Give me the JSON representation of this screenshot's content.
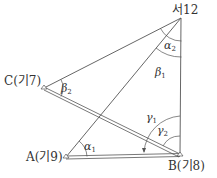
{
  "diagram": {
    "type": "geometry-triangulation",
    "colors": {
      "line": "#555555",
      "text": "#333333",
      "background": "#ffffff"
    },
    "points": {
      "top": {
        "label": "서12",
        "x": 181,
        "y": 18
      },
      "C": {
        "label": "C(기7)",
        "x": 44,
        "y": 88
      },
      "A": {
        "label": "A(기9)",
        "x": 66,
        "y": 157
      },
      "B": {
        "label": "B(기8)",
        "x": 180,
        "y": 155
      }
    },
    "angles": {
      "alpha1": {
        "symbol": "α",
        "sub": "1"
      },
      "alpha2": {
        "symbol": "α",
        "sub": "2"
      },
      "beta1": {
        "symbol": "β",
        "sub": "1"
      },
      "beta2": {
        "symbol": "β",
        "sub": "2"
      },
      "gamma1": {
        "symbol": "γ",
        "sub": "1"
      },
      "gamma2": {
        "symbol": "γ",
        "sub": "2"
      }
    },
    "edges": [
      {
        "from": "top",
        "to": "C",
        "style": "single"
      },
      {
        "from": "top",
        "to": "A",
        "style": "single"
      },
      {
        "from": "top",
        "to": "B",
        "style": "single"
      },
      {
        "from": "C",
        "to": "B",
        "style": "double"
      },
      {
        "from": "A",
        "to": "B",
        "style": "double"
      }
    ]
  }
}
